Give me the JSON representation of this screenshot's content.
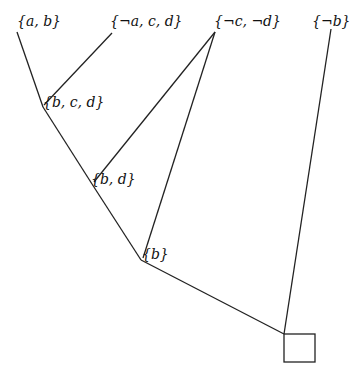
{
  "diagram": {
    "type": "resolution-tree",
    "nodes": [
      {
        "id": "n1",
        "label": "{a, b}",
        "x": 17,
        "y": 14
      },
      {
        "id": "n2",
        "label": "{¬a, c, d}",
        "x": 112,
        "y": 14
      },
      {
        "id": "n3",
        "label": "{¬c, ¬d}",
        "x": 215,
        "y": 14
      },
      {
        "id": "n4",
        "label": "{¬b}",
        "x": 312,
        "y": 14
      },
      {
        "id": "n5",
        "label": "{b, c, d}",
        "x": 43,
        "y": 95
      },
      {
        "id": "n6",
        "label": "{b, d}",
        "x": 92,
        "y": 172
      },
      {
        "id": "n7",
        "label": "{b}",
        "x": 143,
        "y": 246
      },
      {
        "id": "n8",
        "label": "",
        "x": 284,
        "y": 334,
        "shape": "box"
      }
    ],
    "edges": [
      {
        "from": "n1",
        "to": "n5"
      },
      {
        "from": "n2",
        "to": "n5"
      },
      {
        "from": "n5",
        "to": "n6"
      },
      {
        "from": "n3",
        "to": "n6"
      },
      {
        "from": "n6",
        "to": "n7"
      },
      {
        "from": "n3",
        "to": "n7"
      },
      {
        "from": "n7",
        "to": "n8"
      },
      {
        "from": "n4",
        "to": "n8"
      }
    ],
    "empty_clause_symbol": "□"
  }
}
